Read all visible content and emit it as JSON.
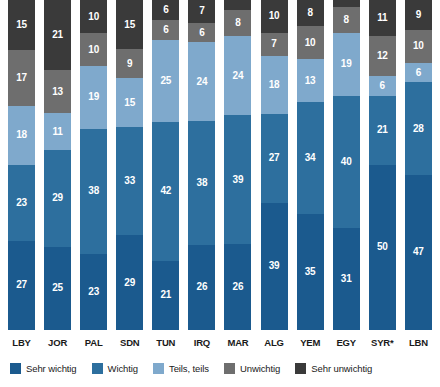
{
  "chart_data": {
    "type": "bar",
    "subtype": "stacked-bar-100-percent",
    "title": "",
    "subtitle": "",
    "xlabel": "",
    "ylabel": "",
    "ylim": [
      0,
      100
    ],
    "grid": false,
    "legend_position": "bottom",
    "orientation": "vertical",
    "stack_order": "bottom-to-top",
    "value_unit": "%",
    "categories": [
      "LBY",
      "JOR",
      "PAL",
      "SDN",
      "TUN",
      "IRQ",
      "MAR",
      "ALG",
      "YEM",
      "EGY",
      "SYR*",
      "LBN"
    ],
    "series": [
      {
        "name": "Sehr wichtig",
        "color": "#1b5a8e",
        "values": [
          27,
          25,
          23,
          29,
          21,
          26,
          26,
          39,
          35,
          31,
          50,
          47
        ]
      },
      {
        "name": "Wichtig",
        "color": "#2d6f9e",
        "values": [
          23,
          29,
          38,
          33,
          42,
          38,
          39,
          27,
          34,
          40,
          21,
          28
        ]
      },
      {
        "name": "Teils, teils",
        "color": "#7fa9cc",
        "values": [
          18,
          11,
          19,
          15,
          25,
          24,
          24,
          18,
          13,
          19,
          6,
          6
        ]
      },
      {
        "name": "Unwichtig",
        "color": "#6e6e6e",
        "values": [
          17,
          13,
          10,
          9,
          6,
          6,
          8,
          7,
          10,
          8,
          12,
          10
        ]
      },
      {
        "name": "Sehr unwichtig",
        "color": "#3a3a3a",
        "values": [
          15,
          21,
          10,
          15,
          6,
          7,
          3,
          10,
          8,
          2,
          11,
          9
        ]
      }
    ],
    "labels_hidden": [
      {
        "category": "MAR",
        "series": "Sehr unwichtig"
      },
      {
        "category": "EGY",
        "series": "Sehr unwichtig"
      }
    ],
    "label_colors": {
      "Sehr wichtig": "#ffffff",
      "Wichtig": "#ffffff",
      "Teils, teils": "#ffffff",
      "Unwichtig": "#ffffff",
      "Sehr unwichtig": "#ffffff"
    }
  },
  "legend": {
    "items": [
      {
        "label": "Sehr wichtig",
        "color": "#1b5a8e"
      },
      {
        "label": "Wichtig",
        "color": "#2d6f9e"
      },
      {
        "label": "Teils, teils",
        "color": "#7fa9cc"
      },
      {
        "label": "Unwichtig",
        "color": "#6e6e6e"
      },
      {
        "label": "Sehr unwichtig",
        "color": "#3a3a3a"
      }
    ]
  },
  "axis": {
    "x_tick_labels": [
      "LBY",
      "JOR",
      "PAL",
      "SDN",
      "TUN",
      "IRQ",
      "MAR",
      "ALG",
      "YEM",
      "EGY",
      "SYR*",
      "LBN"
    ]
  },
  "background_color": "#ffffff"
}
